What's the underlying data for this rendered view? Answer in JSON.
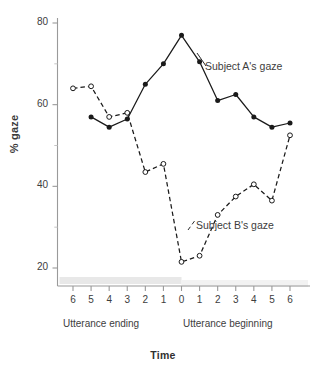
{
  "chart_data": {
    "type": "line",
    "title": "",
    "xlabel": "Time",
    "ylabel": "% gaze",
    "ylim": [
      12,
      84
    ],
    "yticks": [
      20,
      40,
      60,
      80
    ],
    "ytick_labels": [
      "20",
      "40",
      "60",
      "80"
    ],
    "y_minor_ticks": [
      30,
      50,
      70
    ],
    "grid": false,
    "legend_position": "inline-annotation",
    "x": [
      -6,
      -5,
      -4,
      -3,
      -2,
      -1,
      0,
      1,
      2,
      3,
      4,
      5,
      6
    ],
    "xtick_labels": [
      "6",
      "5",
      "4",
      "3",
      "2",
      "1",
      "0",
      "1",
      "2",
      "3",
      "4",
      "5",
      "6"
    ],
    "phase_left_label": "Utterance ending",
    "phase_right_label": "Utterance beginning",
    "series": [
      {
        "name": "Subject A's gaze",
        "style": "solid",
        "marker": "filled-circle",
        "color": "#1a1a1a",
        "x": [
          -5,
          -4,
          -3,
          -2,
          -1,
          0,
          1,
          2,
          3,
          4,
          5,
          6
        ],
        "values": [
          57,
          54.5,
          56.5,
          65,
          70,
          77,
          70.5,
          61,
          62.5,
          57,
          54.5,
          55.5
        ]
      },
      {
        "name": "Subject B's gaze",
        "style": "dashed",
        "marker": "open-circle",
        "color": "#1a1a1a",
        "x": [
          -6,
          -5,
          -4,
          -3,
          -2,
          -1,
          0,
          1,
          2,
          3,
          4,
          5,
          6
        ],
        "values": [
          64,
          64.5,
          57,
          58,
          43.5,
          45.5,
          21.5,
          23,
          33,
          37.5,
          40.5,
          36.5,
          52.5
        ]
      }
    ]
  },
  "axes": {
    "y_title": "% gaze",
    "x_title": "Time"
  },
  "annotations": {
    "series_a_label": "Subject A's gaze",
    "series_b_label": "Subject B's gaze",
    "phase_left": "Utterance ending",
    "phase_right": "Utterance beginning"
  },
  "colors": {
    "ink": "#1a1a1a",
    "axis": "#9a9a9a",
    "text": "#3d3d3d",
    "band_left": "#e8e8e8",
    "band_right": "#f2f2f2",
    "background": "#ffffff"
  }
}
